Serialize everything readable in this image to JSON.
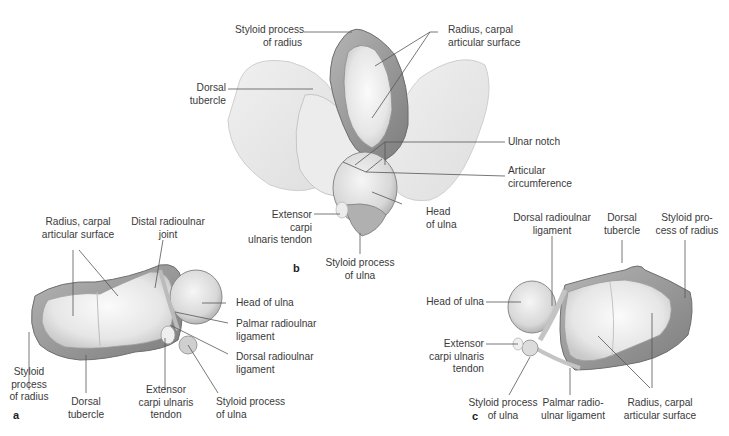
{
  "figure": {
    "panels": [
      {
        "id": "a",
        "letter": "a",
        "labels": {
          "radius_carpal_surface": [
            "Radius, carpal",
            "articular surface"
          ],
          "distal_radioulnar_joint": [
            "Distal radioulnar",
            "joint"
          ],
          "head_of_ulna": [
            "Head of ulna"
          ],
          "palmar_radioulnar_ligament": [
            "Palmar radioulnar",
            "ligament"
          ],
          "dorsal_radioulnar_ligament": [
            "Dorsal radioulnar",
            "ligament"
          ],
          "styloid_process_of_ulna": [
            "Styloid process",
            "of ulna"
          ],
          "extensor_carpi_ulnaris_tendon": [
            "Extensor",
            "carpi ulnaris",
            "tendon"
          ],
          "dorsal_tubercle": [
            "Dorsal",
            "tubercle"
          ],
          "styloid_process_of_radius": [
            "Styloid",
            "process",
            "of radius"
          ]
        }
      },
      {
        "id": "b",
        "letter": "b",
        "labels": {
          "styloid_process_of_radius": [
            "Styloid process",
            "of radius"
          ],
          "radius_carpal_surface": [
            "Radius, carpal",
            "articular surface"
          ],
          "dorsal_tubercle": [
            "Dorsal",
            "tubercle"
          ],
          "ulnar_notch": [
            "Ulnar notch"
          ],
          "articular_circumference": [
            "Articular",
            "circumference"
          ],
          "head_of_ulna": [
            "Head",
            "of ulna"
          ],
          "extensor_carpi_ulnaris_tendon": [
            "Extensor",
            "carpi",
            "ulnaris tendon"
          ],
          "styloid_process_of_ulna": [
            "Styloid process",
            "of ulna"
          ]
        }
      },
      {
        "id": "c",
        "letter": "c",
        "labels": {
          "dorsal_radioulnar_ligament": [
            "Dorsal radioulnar",
            "ligament"
          ],
          "dorsal_tubercle": [
            "Dorsal",
            "tubercle"
          ],
          "styloid_process_of_radius": [
            "Styloid pro-",
            "cess of radius"
          ],
          "head_of_ulna": [
            "Head of ulna"
          ],
          "extensor_carpi_ulnaris_tendon": [
            "Extensor",
            "carpi ulnaris",
            "tendon"
          ],
          "styloid_process_of_ulna": [
            "Styloid process",
            "of ulna"
          ],
          "palmar_radioulnar_ligament": [
            "Palmar radio-",
            "ulnar ligament"
          ],
          "radius_carpal_surface": [
            "Radius, carpal",
            "articular surface"
          ]
        }
      }
    ],
    "colors": {
      "bone_light": "#f1f1f1",
      "bone_mid": "#d9d9d9",
      "bone_dark": "#8e8e8e",
      "leader_line": "#555555",
      "text": "#3a3a3a"
    }
  }
}
